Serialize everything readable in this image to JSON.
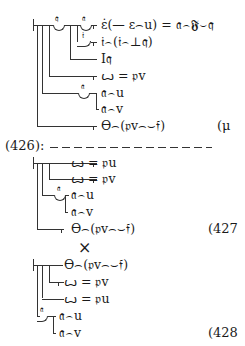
{
  "block1": {
    "rows": [
      "ε̇(— ε⌢u) = 𝔞⌢𝕱⌣𝔮",
      "𝔦⌢(𝔦⌢⊥𝔮)",
      "I𝔮",
      "ꙍ = 𝔭v",
      "𝔞⌢u",
      "𝔞⌢v",
      "ϴ⌢(𝔭v⌢⌣𝔣)"
    ],
    "concavity_labels": [
      "𝔮",
      "𝔞",
      "𝔦",
      "𝔞"
    ],
    "equation_ref": "(μ"
  },
  "separator": {
    "label": "(426):"
  },
  "block2": {
    "rows": [
      "ꙍ = 𝔭u",
      "ꙍ = 𝔭v",
      "𝔞⌢u",
      "𝔞⌢v",
      "ϴ⌢(𝔭v⌢⌣𝔣)"
    ],
    "concavity_labels": [
      "𝔞"
    ],
    "equation_ref": "(427"
  },
  "cross": "×",
  "block3": {
    "rows": [
      "ϴ⌢(𝔭v⌢⌣𝔣)",
      "ꙍ = 𝔭v",
      "ꙍ = 𝔭u",
      "𝔞⌢u",
      "𝔞⌢v"
    ],
    "concavity_labels": [
      "𝔞"
    ],
    "equation_ref": "(428"
  }
}
